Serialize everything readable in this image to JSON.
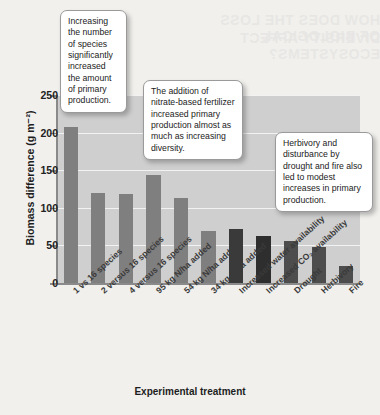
{
  "chart_data": {
    "type": "bar",
    "title": "",
    "xlabel": "Experimental treatment",
    "ylabel": "Biomass difference (g m⁻²)",
    "ylim": [
      0,
      250
    ],
    "yticks": [
      0,
      50,
      100,
      150,
      200,
      250
    ],
    "grid": true,
    "legend": "none",
    "categories": [
      "1 vs 16 species",
      "2 versus 16 species",
      "4 versus 16 species",
      "95 kg N/ha added",
      "54 kg N/ha added",
      "34 kg N/ha added",
      "Increased water availability",
      "Increased CO₂ availability",
      "Drought",
      "Herbivory",
      "Fire"
    ],
    "values": [
      207,
      120,
      118,
      144,
      113,
      69,
      72,
      63,
      56,
      48,
      22
    ],
    "bar_colors": [
      "#807f7f",
      "#807f7f",
      "#807f7f",
      "#807f7f",
      "#807f7f",
      "#807f7f",
      "#3a3a3a",
      "#2e2e2e",
      "#4d4d4d",
      "#4d4d4d",
      "#4d4d4d"
    ],
    "plot_background": "#cfcfcf",
    "gridline_color": "#f2f2f2"
  },
  "annotations": [
    {
      "id": "callout-diversity",
      "text": "Increasing the number of species significantly increased the amount of primary production."
    },
    {
      "id": "callout-fertilizer",
      "text": "The addition of nitrate-based fertilizer increased primary production almost as much as increasing diversity."
    },
    {
      "id": "callout-disturbance",
      "text": "Herbivory and disturbance by drought and fire also led to modest increases in primary production."
    }
  ],
  "showthrough": [
    "HOW DOES THE LOSS OF BIOLOGICAL",
    "DIVERSITY AFFECT ECOSYSTEMS?"
  ]
}
